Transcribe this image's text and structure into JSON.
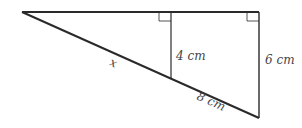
{
  "diagram": {
    "type": "similar right triangles",
    "labels": {
      "x": "x",
      "inner_height": "4 cm",
      "outer_height": "6 cm",
      "hyp_segment": "8 cm"
    },
    "colors": {
      "line": "#2a2a2a",
      "text": "#444444",
      "background": "#ffffff"
    }
  }
}
